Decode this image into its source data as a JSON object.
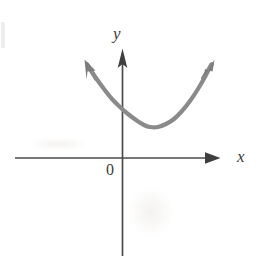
{
  "figure": {
    "background_color": "#ffffff",
    "width": 263,
    "height": 256
  },
  "axes": {
    "x_axis": {
      "label": "x",
      "color": "#4a4a4a",
      "stroke_width": 1.6,
      "start_x": 15,
      "end_x": 220,
      "y": 158,
      "arrow": "right",
      "arrow_style": "solid-triangle"
    },
    "y_axis": {
      "label": "y",
      "color": "#4a4a4a",
      "stroke_width": 1.6,
      "x": 122,
      "start_y": 50,
      "end_y": 256,
      "arrow": "up",
      "arrow_style": "solid-triangle"
    },
    "origin": {
      "label": "0",
      "x": 122,
      "y": 158
    }
  },
  "chart_data": {
    "type": "line",
    "title": "",
    "xlabel": "x",
    "ylabel": "y",
    "grid": false,
    "legend": null,
    "curve": {
      "name": "parabola",
      "shape": "upward-opening parabola",
      "color": "#8a8a8a",
      "stroke_width": 4.2,
      "vertex_px": [
        148,
        127
      ],
      "y_intercept_px": [
        122,
        113
      ],
      "left_arrow_tip_px": [
        85,
        62
      ],
      "right_arrow_tip_px": [
        213,
        62
      ],
      "arrows": "both-ends",
      "points_px": [
        [
          88,
          66
        ],
        [
          96,
          78
        ],
        [
          104,
          89
        ],
        [
          112,
          99
        ],
        [
          120,
          107
        ],
        [
          128,
          114
        ],
        [
          136,
          120
        ],
        [
          144,
          125
        ],
        [
          150,
          127
        ],
        [
          158,
          127
        ],
        [
          166,
          124
        ],
        [
          174,
          119
        ],
        [
          182,
          111
        ],
        [
          190,
          101
        ],
        [
          198,
          89
        ],
        [
          206,
          75
        ],
        [
          211,
          65
        ]
      ]
    }
  },
  "annotations": {
    "y_label": "y",
    "x_label": "x",
    "origin_label": "0"
  }
}
